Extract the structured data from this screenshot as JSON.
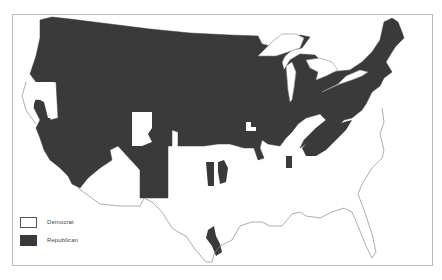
{
  "map": {
    "subject": "United States (contiguous) party map",
    "colors": {
      "democrat": "#ffffff",
      "republican": "#3a3a3a",
      "border": "#8a8a8a",
      "frame": "#b9b9b9"
    }
  },
  "legend": {
    "items": [
      {
        "label": "Democrat",
        "swatch": "white"
      },
      {
        "label": "Republican",
        "swatch": "dark"
      }
    ]
  }
}
